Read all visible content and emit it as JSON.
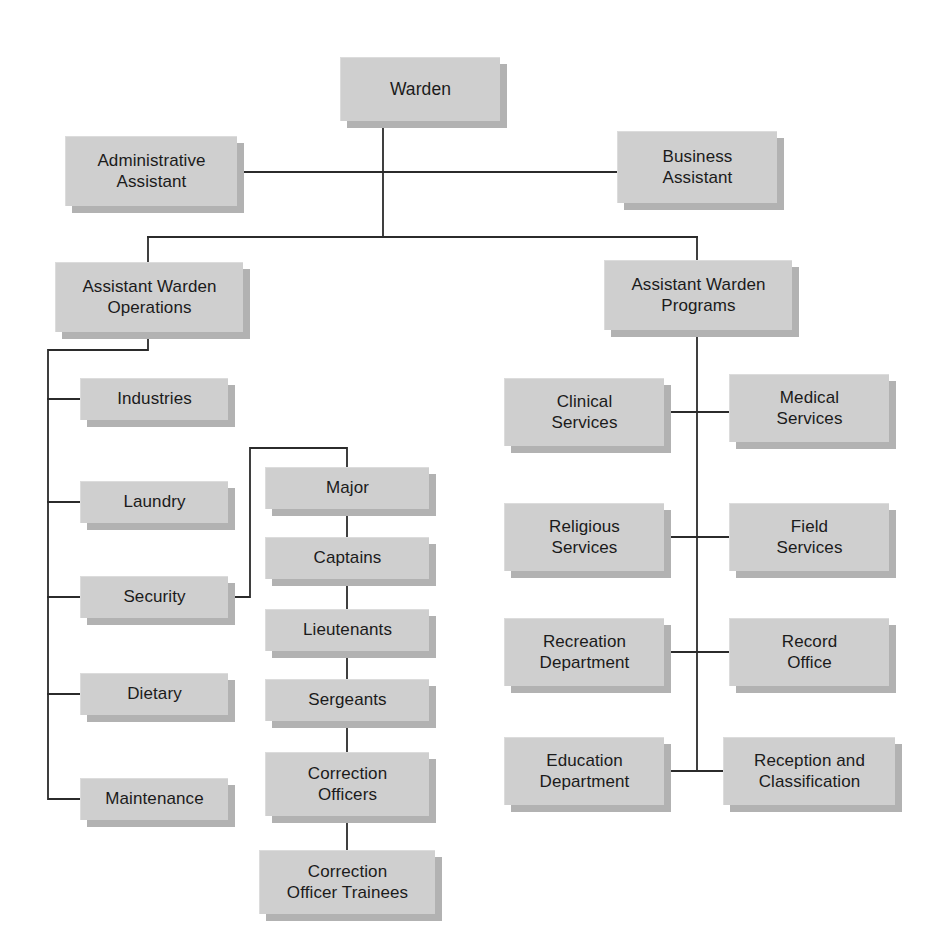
{
  "document": {
    "type": "organizational-chart",
    "title": "Correctional Facility Organizational Chart",
    "background_color": "#ffffff",
    "node_fill_color": "#cfcfcf",
    "node_shadow_color": "#b2b2b2",
    "connector_color": "#2b2b2b",
    "text_color": "#1b1b1b"
  },
  "chart_data": {
    "type": "diagram",
    "subtype": "hierarchical-org-chart",
    "node_count": 24,
    "levels": [
      "Warden",
      "Assistants",
      "Assistant Wardens",
      "Departments",
      "Security Chain"
    ]
  },
  "nodes": [
    {
      "id": "warden",
      "label": "Warden",
      "x": 340,
      "y": 57,
      "w": 160,
      "h": 64,
      "group": "root"
    },
    {
      "id": "admin-assistant",
      "label": "Administrative\nAssistant",
      "x": 65,
      "y": 136,
      "w": 172,
      "h": 70,
      "group": "assistant"
    },
    {
      "id": "business-assistant",
      "label": "Business\nAssistant",
      "x": 617,
      "y": 131,
      "w": 160,
      "h": 72,
      "group": "assistant"
    },
    {
      "id": "aw-operations",
      "label": "Assistant Warden\nOperations",
      "x": 55,
      "y": 262,
      "w": 188,
      "h": 70,
      "group": "assistant-warden"
    },
    {
      "id": "aw-programs",
      "label": "Assistant Warden\nPrograms",
      "x": 604,
      "y": 260,
      "w": 188,
      "h": 70,
      "group": "assistant-warden"
    },
    {
      "id": "industries",
      "label": "Industries",
      "x": 80,
      "y": 378,
      "w": 148,
      "h": 42,
      "group": "operations"
    },
    {
      "id": "laundry",
      "label": "Laundry",
      "x": 80,
      "y": 481,
      "w": 148,
      "h": 42,
      "group": "operations"
    },
    {
      "id": "security",
      "label": "Security",
      "x": 80,
      "y": 576,
      "w": 148,
      "h": 42,
      "group": "operations"
    },
    {
      "id": "dietary",
      "label": "Dietary",
      "x": 80,
      "y": 673,
      "w": 148,
      "h": 42,
      "group": "operations"
    },
    {
      "id": "maintenance",
      "label": "Maintenance",
      "x": 80,
      "y": 778,
      "w": 148,
      "h": 42,
      "group": "operations"
    },
    {
      "id": "major",
      "label": "Major",
      "x": 265,
      "y": 467,
      "w": 164,
      "h": 42,
      "group": "security-chain"
    },
    {
      "id": "captains",
      "label": "Captains",
      "x": 265,
      "y": 537,
      "w": 164,
      "h": 42,
      "group": "security-chain"
    },
    {
      "id": "lieutenants",
      "label": "Lieutenants",
      "x": 265,
      "y": 609,
      "w": 164,
      "h": 42,
      "group": "security-chain"
    },
    {
      "id": "sergeants",
      "label": "Sergeants",
      "x": 265,
      "y": 679,
      "w": 164,
      "h": 42,
      "group": "security-chain"
    },
    {
      "id": "correction-officers",
      "label": "Correction\nOfficers",
      "x": 265,
      "y": 752,
      "w": 164,
      "h": 64,
      "group": "security-chain"
    },
    {
      "id": "correction-officer-trainees",
      "label": "Correction\nOfficer Trainees",
      "x": 259,
      "y": 850,
      "w": 176,
      "h": 64,
      "group": "security-chain"
    },
    {
      "id": "clinical-services",
      "label": "Clinical\nServices",
      "x": 504,
      "y": 378,
      "w": 160,
      "h": 68,
      "group": "programs-left"
    },
    {
      "id": "medical-services",
      "label": "Medical\nServices",
      "x": 729,
      "y": 374,
      "w": 160,
      "h": 68,
      "group": "programs-right"
    },
    {
      "id": "religious-services",
      "label": "Religious\nServices",
      "x": 504,
      "y": 503,
      "w": 160,
      "h": 68,
      "group": "programs-left"
    },
    {
      "id": "field-services",
      "label": "Field\nServices",
      "x": 729,
      "y": 503,
      "w": 160,
      "h": 68,
      "group": "programs-right"
    },
    {
      "id": "recreation-department",
      "label": "Recreation\nDepartment",
      "x": 504,
      "y": 618,
      "w": 160,
      "h": 68,
      "group": "programs-left"
    },
    {
      "id": "record-office",
      "label": "Record\nOffice",
      "x": 729,
      "y": 618,
      "w": 160,
      "h": 68,
      "group": "programs-right"
    },
    {
      "id": "education-department",
      "label": "Education\nDepartment",
      "x": 504,
      "y": 737,
      "w": 160,
      "h": 68,
      "group": "programs-left"
    },
    {
      "id": "reception-classification",
      "label": "Reception and\nClassification",
      "x": 723,
      "y": 737,
      "w": 172,
      "h": 68,
      "group": "programs-right"
    }
  ],
  "connectors": [
    {
      "id": "warden-trunk",
      "points": "383,121 383,237"
    },
    {
      "id": "assistants-crossbar",
      "points": "237,172 617,172"
    },
    {
      "id": "aw-crossbar",
      "points": "148,237 697,237"
    },
    {
      "id": "aw-operations-drop",
      "points": "148,237 148,262"
    },
    {
      "id": "aw-programs-drop",
      "points": "697,237 697,260"
    },
    {
      "id": "operations-rail",
      "points": "148,332 148,350 48,350 48,799 80,799"
    },
    {
      "id": "operations-stub-industries",
      "points": "48,399 80,399"
    },
    {
      "id": "operations-stub-laundry",
      "points": "48,502 80,502"
    },
    {
      "id": "operations-stub-security",
      "points": "48,597 80,597"
    },
    {
      "id": "operations-stub-dietary",
      "points": "48,694 80,694"
    },
    {
      "id": "security-to-major",
      "points": "228,597 250,597 250,448 347,448 347,467"
    },
    {
      "id": "major-captains",
      "points": "347,509 347,537"
    },
    {
      "id": "captains-lieutenants",
      "points": "347,579 347,609"
    },
    {
      "id": "lieutenants-sergeants",
      "points": "347,651 347,679"
    },
    {
      "id": "sergeants-officers",
      "points": "347,721 347,752"
    },
    {
      "id": "officers-trainees",
      "points": "347,816 347,850"
    },
    {
      "id": "programs-spine",
      "points": "697,330 697,771"
    },
    {
      "id": "programs-bar-row1",
      "points": "664,412 729,412"
    },
    {
      "id": "programs-bar-row2",
      "points": "664,537 729,537"
    },
    {
      "id": "programs-bar-row3",
      "points": "664,652 729,652"
    },
    {
      "id": "programs-bar-row4",
      "points": "664,771 723,771"
    }
  ]
}
